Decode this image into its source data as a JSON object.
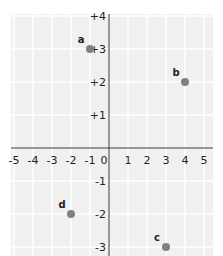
{
  "chart_data": {
    "type": "scatter",
    "title": "",
    "xlabel": "",
    "ylabel": "",
    "xlim": [
      -5,
      5
    ],
    "ylim": [
      -3,
      4
    ],
    "grid": true,
    "x_ticks": [
      "-5",
      "-4",
      "-3",
      "-2",
      "-1",
      "0",
      "1",
      "2",
      "3",
      "4",
      "5"
    ],
    "y_ticks": [
      "+4",
      "+3",
      "+2",
      "+1",
      "-1",
      "-2",
      "-3"
    ],
    "points": [
      {
        "label": "a",
        "x": -1,
        "y": 3
      },
      {
        "label": "b",
        "x": 4,
        "y": 2
      },
      {
        "label": "c",
        "x": 3,
        "y": -3
      },
      {
        "label": "d",
        "x": -2,
        "y": -2
      }
    ],
    "point_color": "#808080",
    "grid_color": "#ffffff",
    "background_color": "#f0f0f0",
    "axis_color": "#333333"
  }
}
